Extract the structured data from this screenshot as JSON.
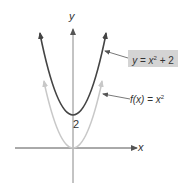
{
  "diagram": {
    "type": "function-graph",
    "axes": {
      "x_label": "x",
      "y_label": "y"
    },
    "intercept_label": "2",
    "curves": [
      {
        "name": "shifted-parabola",
        "label": "y = x² + 2",
        "label_parts": {
          "lhs": "y",
          "eq": " = ",
          "base": "x",
          "exp": "2",
          "rest": " + 2"
        },
        "color": "#444444",
        "vertex": [
          0,
          2
        ],
        "highlighted": true
      },
      {
        "name": "base-parabola",
        "label": "f(x) = x²",
        "label_parts": {
          "lhs": "f(x)",
          "eq": " = ",
          "base": "x",
          "exp": "2"
        },
        "color": "#c8c8c8",
        "vertex": [
          0,
          0
        ]
      }
    ],
    "colors": {
      "dark_curve": "#444444",
      "light_curve": "#c8c8c8",
      "label_box": "#d4d4d4",
      "axis": "#555555"
    }
  }
}
